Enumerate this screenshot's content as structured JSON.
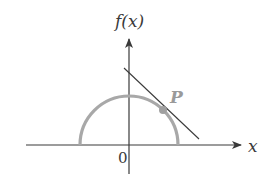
{
  "diagram": {
    "y_axis_label": "f(x)",
    "x_axis_label": "x",
    "origin_label": "0",
    "point_label": "P",
    "colors": {
      "axes": "#3a3a3a",
      "curve": "#a8a8a8",
      "tangent": "#3a3a3a",
      "point": "#a0a0a0",
      "background": "#ffffff"
    },
    "elements": [
      {
        "name": "x-axis",
        "type": "arrow",
        "from": [
          26,
          145
        ],
        "to": [
          242,
          145
        ]
      },
      {
        "name": "y-axis",
        "type": "arrow",
        "from": [
          129,
          174
        ],
        "to": [
          129,
          38
        ]
      },
      {
        "name": "semicircle",
        "type": "arc",
        "center": [
          129,
          145
        ],
        "radius": 49,
        "upper_half": true
      },
      {
        "name": "tangent-line",
        "type": "line",
        "from": [
          124,
          68
        ],
        "to": [
          199,
          139
        ]
      },
      {
        "name": "point-P",
        "type": "point",
        "at": [
          163,
          110
        ]
      }
    ]
  }
}
